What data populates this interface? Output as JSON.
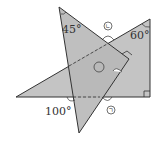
{
  "diagram": {
    "type": "overlapping-triangles",
    "colors": {
      "fill": "#bdbdbd",
      "stroke": "#333333",
      "background": "#ffffff"
    },
    "triangle_45": {
      "vertices": [
        [
          59,
          7
        ],
        [
          129,
          59
        ],
        [
          79,
          133
        ]
      ],
      "angle_label": "45°",
      "right_angle_at": "vertex-2"
    },
    "triangle_60": {
      "vertices": [
        [
          16,
          97
        ],
        [
          150,
          19
        ],
        [
          150,
          97
        ]
      ],
      "angle_label": "60°",
      "right_angle_at": "vertex-3"
    },
    "labels": {
      "angle_45": "45°",
      "angle_60": "60°",
      "angle_100": "100°",
      "mark_top": "ㄴ",
      "mark_bottom": "ㄱ",
      "mark_center": ""
    }
  }
}
